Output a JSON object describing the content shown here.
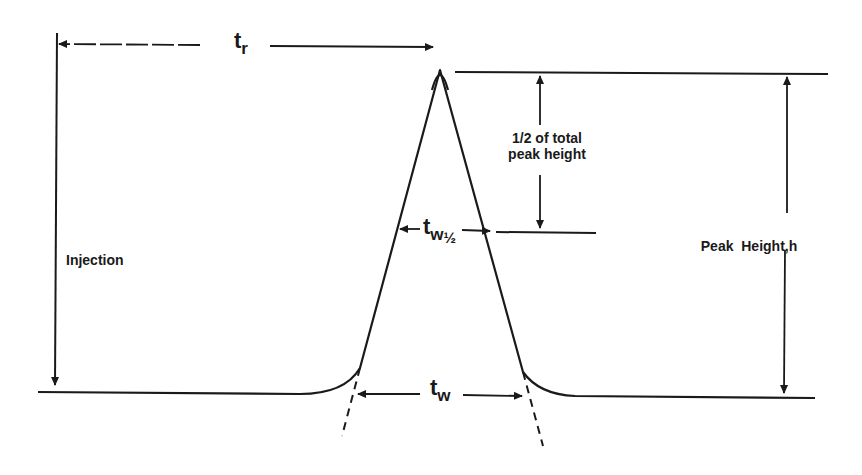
{
  "diagram": {
    "type": "chromatography-peak-schematic",
    "stroke_color": "#1a1a1a",
    "background": "#ffffff",
    "labels": {
      "retention_time": {
        "symbol": "t",
        "subscript": "r"
      },
      "half_width": {
        "symbol": "t",
        "subscript": "w",
        "fraction": "½"
      },
      "base_width": {
        "symbol": "t",
        "subscript": "w"
      },
      "half_height_line1": "1/2 of total",
      "half_height_line2": "peak height",
      "peak_height": "Peak  Height,h",
      "injection": "Injection"
    }
  }
}
